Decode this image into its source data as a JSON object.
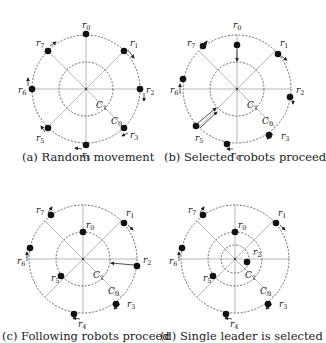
{
  "panels": [
    {
      "id": "a",
      "caption": "(a) Random movement",
      "center": [
        86,
        89
      ],
      "outer_radius": 54,
      "inner_radius": 27,
      "circle_labels": {
        "outer": "C0",
        "inner": "C1"
      },
      "robots": [
        {
          "label": "r0",
          "pos": [
            86,
            34
          ],
          "label_pos": [
            82,
            28
          ]
        },
        {
          "label": "r1",
          "pos": [
            124,
            51
          ],
          "label_pos": [
            130,
            46
          ]
        },
        {
          "label": "r2",
          "pos": [
            140,
            89
          ],
          "label_pos": [
            146,
            93
          ]
        },
        {
          "label": "r3",
          "pos": [
            124,
            128
          ],
          "label_pos": [
            130,
            138
          ]
        },
        {
          "label": "r4",
          "pos": [
            86,
            145
          ],
          "label_pos": [
            82,
            158
          ]
        },
        {
          "label": "r5",
          "pos": [
            48,
            128
          ],
          "label_pos": [
            36,
            141
          ]
        },
        {
          "label": "r6",
          "pos": [
            32,
            89
          ],
          "label_pos": [
            18,
            93
          ]
        },
        {
          "label": "r7",
          "pos": [
            48,
            51
          ],
          "label_pos": [
            36,
            46
          ]
        }
      ]
    },
    {
      "id": "b",
      "caption": "(b) Selected robots proceed",
      "center": [
        237,
        89
      ],
      "outer_radius": 54,
      "inner_radius": 27,
      "circle_labels": {
        "outer": "C0",
        "inner": "C1"
      },
      "robots": [
        {
          "label": "r0",
          "pos": [
            237,
            45
          ],
          "label_pos": [
            233,
            28
          ]
        },
        {
          "label": "r1",
          "pos": [
            278,
            54
          ],
          "label_pos": [
            280,
            46
          ]
        },
        {
          "label": "r2",
          "pos": [
            290,
            97
          ],
          "label_pos": [
            296,
            93
          ]
        },
        {
          "label": "r3",
          "pos": [
            269,
            135
          ],
          "label_pos": [
            281,
            139
          ]
        },
        {
          "label": "r4",
          "pos": [
            227,
            144
          ],
          "label_pos": [
            231,
            158
          ]
        },
        {
          "label": "r5",
          "pos": [
            196,
            126
          ],
          "label_pos": [
            195,
            141
          ]
        },
        {
          "label": "r6",
          "pos": [
            183,
            79
          ],
          "label_pos": [
            170,
            93
          ]
        },
        {
          "label": "r7",
          "pos": [
            203,
            46
          ],
          "label_pos": [
            187,
            46
          ]
        }
      ]
    },
    {
      "id": "c",
      "caption": "(c) Following robots proceed",
      "center": [
        83,
        259
      ],
      "outer_radius": 54,
      "inner_radius": 27,
      "circle_labels": {
        "outer": "C0",
        "inner": "C1"
      },
      "robots": [
        {
          "label": "r0",
          "pos": [
            83,
            232
          ],
          "label_pos": [
            86,
            228
          ]
        },
        {
          "label": "r1",
          "pos": [
            124,
            223
          ],
          "label_pos": [
            126,
            216
          ]
        },
        {
          "label": "r2",
          "pos": [
            137,
            266
          ],
          "label_pos": [
            143,
            263
          ]
        },
        {
          "label": "r3",
          "pos": [
            116,
            304
          ],
          "label_pos": [
            127,
            307
          ]
        },
        {
          "label": "r4",
          "pos": [
            74,
            314
          ],
          "label_pos": [
            78,
            327
          ]
        },
        {
          "label": "r5",
          "pos": [
            61,
            276
          ],
          "label_pos": [
            51,
            281
          ]
        },
        {
          "label": "r6",
          "pos": [
            30,
            248
          ],
          "label_pos": [
            17,
            264
          ]
        },
        {
          "label": "r7",
          "pos": [
            51,
            215
          ],
          "label_pos": [
            36,
            213
          ]
        }
      ]
    },
    {
      "id": "d",
      "caption": "(d) Single leader is selected",
      "center": [
        235,
        259
      ],
      "outer_radius": 54,
      "inner_radius": 27,
      "innermost_radius": 14,
      "circle_labels": {
        "outer": "C0",
        "inner": "C1"
      },
      "robots": [
        {
          "label": "r0",
          "pos": [
            235,
            232
          ],
          "label_pos": [
            238,
            228
          ]
        },
        {
          "label": "r1",
          "pos": [
            276,
            223
          ],
          "label_pos": [
            278,
            216
          ]
        },
        {
          "label": "r2",
          "pos": [
            247,
            262
          ],
          "label_pos": [
            253,
            255
          ]
        },
        {
          "label": "r3",
          "pos": [
            268,
            304
          ],
          "label_pos": [
            279,
            307
          ]
        },
        {
          "label": "r4",
          "pos": [
            226,
            314
          ],
          "label_pos": [
            230,
            327
          ]
        },
        {
          "label": "r5",
          "pos": [
            213,
            276
          ],
          "label_pos": [
            203,
            281
          ]
        },
        {
          "label": "r6",
          "pos": [
            182,
            248
          ],
          "label_pos": [
            169,
            264
          ]
        },
        {
          "label": "r7",
          "pos": [
            203,
            215
          ],
          "label_pos": [
            188,
            213
          ]
        }
      ]
    }
  ]
}
